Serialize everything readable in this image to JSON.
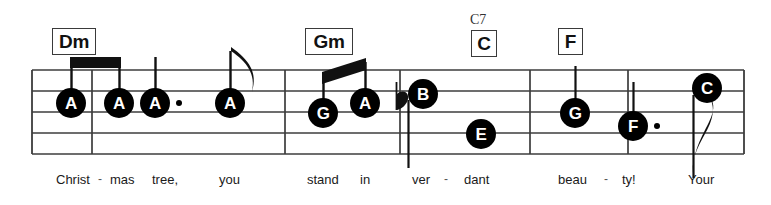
{
  "score": {
    "title_visible": false,
    "staff": {
      "line_color": "#3c3c3c",
      "top_line_y": 70,
      "line_spacing": 21,
      "left_x": 32,
      "right_x": 744
    },
    "chords": [
      {
        "label": "Dm",
        "x": 52,
        "y": 28,
        "w": 44,
        "h": 27,
        "alt": null
      },
      {
        "label": "Gm",
        "x": 305,
        "y": 28,
        "w": 48,
        "h": 27,
        "alt": null
      },
      {
        "label": "C",
        "x": 471,
        "y": 30,
        "w": 26,
        "h": 27,
        "alt": "C7",
        "alt_x": 470,
        "alt_y": 12
      },
      {
        "label": "F",
        "x": 558,
        "y": 28,
        "w": 25,
        "h": 27,
        "alt": null
      }
    ],
    "barlines": [
      92,
      285,
      400,
      530,
      628
    ],
    "notes": [
      {
        "letter": "A",
        "x": 56,
        "y": 103,
        "d": 30,
        "stem": "up",
        "dotted": false,
        "beamed": true,
        "flag": false
      },
      {
        "letter": "A",
        "x": 104,
        "y": 103,
        "d": 30,
        "stem": "up",
        "dotted": false,
        "beamed": true,
        "flag": false
      },
      {
        "letter": "A",
        "x": 140,
        "y": 103,
        "d": 30,
        "stem": "up",
        "dotted": true,
        "beamed": false,
        "flag": false
      },
      {
        "letter": "A",
        "x": 215,
        "y": 103,
        "d": 30,
        "stem": "up",
        "dotted": false,
        "beamed": false,
        "flag": true
      },
      {
        "letter": "G",
        "x": 308,
        "y": 113,
        "d": 30,
        "stem": "up",
        "dotted": false,
        "beamed": true,
        "flag": false
      },
      {
        "letter": "A",
        "x": 350,
        "y": 103,
        "d": 30,
        "stem": "up",
        "dotted": false,
        "beamed": true,
        "flag": false
      },
      {
        "letter": "B",
        "x": 408,
        "y": 94,
        "d": 30,
        "stem": "down",
        "dotted": false,
        "beamed": false,
        "flag": false,
        "accidental": "flat"
      },
      {
        "letter": "E",
        "x": 466,
        "y": 134,
        "d": 30,
        "stem": "none",
        "dotted": false,
        "beamed": false,
        "flag": false
      },
      {
        "letter": "G",
        "x": 560,
        "y": 113,
        "d": 30,
        "stem": "up",
        "dotted": false,
        "beamed": false,
        "flag": false
      },
      {
        "letter": "F",
        "x": 618,
        "y": 126,
        "d": 30,
        "stem": "up",
        "dotted": true,
        "beamed": false,
        "flag": false
      },
      {
        "letter": "C",
        "x": 692,
        "y": 88,
        "d": 30,
        "stem": "down",
        "dotted": false,
        "beamed": false,
        "flag": true
      }
    ],
    "accidentals": [
      {
        "symbol": "flat",
        "x": 396,
        "y": 96
      }
    ],
    "lyrics": [
      {
        "text": "Christ",
        "x": 56,
        "hyphen": false
      },
      {
        "text": "-",
        "x": 98,
        "hyphen": true
      },
      {
        "text": "mas",
        "x": 110,
        "hyphen": false
      },
      {
        "text": "tree,",
        "x": 152,
        "hyphen": false
      },
      {
        "text": "you",
        "x": 219,
        "hyphen": false
      },
      {
        "text": "stand",
        "x": 307,
        "hyphen": false
      },
      {
        "text": "in",
        "x": 360,
        "hyphen": false
      },
      {
        "text": "ver",
        "x": 412,
        "hyphen": false
      },
      {
        "text": "-",
        "x": 444,
        "hyphen": true
      },
      {
        "text": "dant",
        "x": 464,
        "hyphen": false
      },
      {
        "text": "beau",
        "x": 558,
        "hyphen": false
      },
      {
        "text": "-",
        "x": 604,
        "hyphen": true
      },
      {
        "text": "ty!",
        "x": 622,
        "hyphen": false
      },
      {
        "text": "Your",
        "x": 688,
        "hyphen": false
      }
    ]
  }
}
